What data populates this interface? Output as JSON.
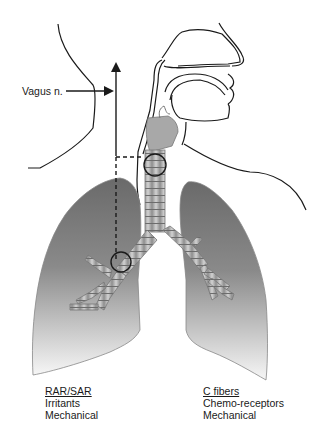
{
  "diagram": {
    "labels": {
      "vagus": "Vagus n.",
      "left_group": {
        "title": "RAR/SAR",
        "lines": [
          "Irritants",
          "Mechanical"
        ]
      },
      "right_group": {
        "title": "C fibers",
        "lines": [
          "Chemo-receptors",
          "Mechanical"
        ]
      }
    },
    "colors": {
      "outline": "#1a1a1a",
      "lung_dark": "#6e6e6e",
      "lung_light": "#f4f4f4",
      "airway_fill": "#b8b8b8",
      "airway_ring": "#7a7a7a"
    }
  }
}
